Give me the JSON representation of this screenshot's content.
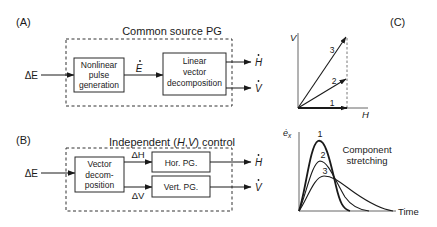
{
  "panel_a": {
    "tag": "(A)",
    "title": "Common source PG",
    "input": "ΔE",
    "block1": [
      "Nonlinear",
      "pulse",
      "generation"
    ],
    "intermediate": "E",
    "block2": [
      "Linear",
      "vector",
      "decomposition"
    ],
    "output_h": "H",
    "output_v": "V"
  },
  "panel_b": {
    "tag": "(B)",
    "title_prefix": "Independent (",
    "title_h": "H",
    "title_sep": ",",
    "title_v": "V",
    "title_suffix": ") control",
    "input": "ΔE",
    "block1": [
      "Vector",
      "decom-",
      "position"
    ],
    "delta_h": "ΔH",
    "delta_v": "ΔV",
    "hor_block": "Hor. PG.",
    "vert_block": "Vert. PG.",
    "output_h": "H",
    "output_v": "V"
  },
  "panel_c": {
    "tag": "(C)",
    "vector_plot": {
      "x_axis": "H",
      "y_axis": "V",
      "vectors": [
        {
          "label": "1",
          "h": 1.0,
          "v": 0.0
        },
        {
          "label": "2",
          "h": 1.0,
          "v": 0.55
        },
        {
          "label": "3",
          "h": 1.0,
          "v": 1.4
        }
      ]
    },
    "pulse_plot": {
      "y_axis": "ė",
      "y_axis_sub": "x",
      "x_axis": "Time",
      "annotation_line1": "Component",
      "annotation_line2": "stretching",
      "curves": [
        {
          "label": "1",
          "peak": 1.0,
          "width": 1.0
        },
        {
          "label": "2",
          "peak": 0.68,
          "width": 1.45
        },
        {
          "label": "3",
          "peak": 0.5,
          "width": 2.0
        }
      ]
    }
  }
}
